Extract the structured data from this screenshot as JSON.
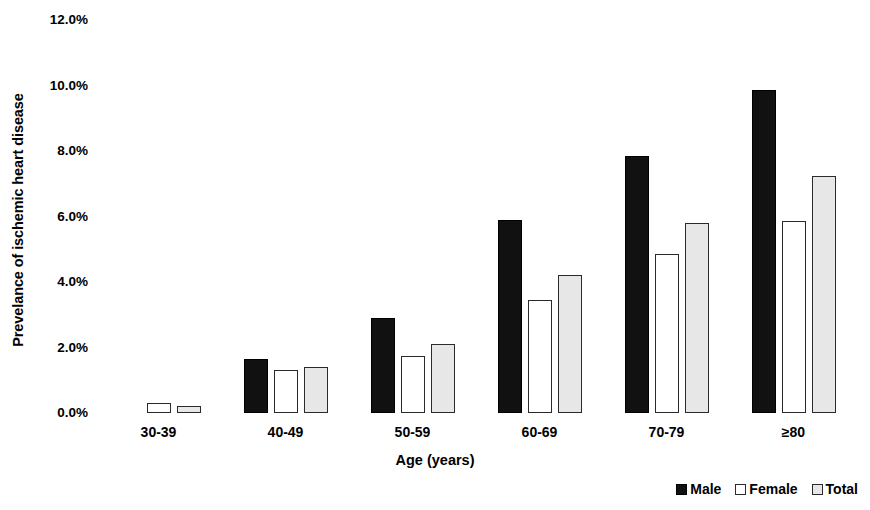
{
  "chart_data": {
    "type": "bar",
    "title": "",
    "subtitle": "",
    "xlabel": "Age (years)",
    "ylabel": "Prevelance of ischemic heart disease",
    "categories": [
      "30-39",
      "40-49",
      "50-59",
      "60-69",
      "70-79",
      "≥80"
    ],
    "series": [
      {
        "name": "Male",
        "color": "#111111",
        "values": [
          0.0,
          1.65,
          2.9,
          5.9,
          7.85,
          9.85
        ]
      },
      {
        "name": "Female",
        "color": "#ffffff",
        "values": [
          0.3,
          1.3,
          1.75,
          3.45,
          4.85,
          5.85
        ]
      },
      {
        "name": "Total",
        "color": "#e7e7e7",
        "values": [
          0.2,
          1.4,
          2.1,
          4.2,
          5.8,
          7.25
        ]
      }
    ],
    "ylim": [
      0.0,
      12.0
    ],
    "y_ticks": [
      0.0,
      2.0,
      4.0,
      6.0,
      8.0,
      10.0,
      12.0
    ],
    "y_tick_labels": [
      "0.0%",
      "2.0%",
      "4.0%",
      "6.0%",
      "8.0%",
      "10.0%",
      "12.0%"
    ],
    "grid": false,
    "legend_position": "bottom-right",
    "legend_entries": [
      "Male",
      "Female",
      "Total"
    ],
    "value_unit": "%"
  }
}
